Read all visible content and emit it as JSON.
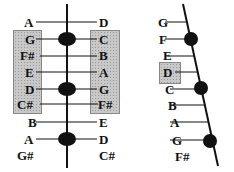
{
  "left_diagram": {
    "left_labels": [
      "A",
      "G",
      "F#",
      "E",
      "D",
      "C#",
      "B",
      "A",
      "G#"
    ],
    "right_labels": [
      "D",
      "C",
      "B",
      "A",
      "G",
      "F#",
      "E",
      "D",
      "C#"
    ],
    "dots_at_rows": [
      1,
      4,
      7
    ],
    "highlighted_rows": [
      1,
      2,
      3,
      4,
      5
    ]
  },
  "right_diagram": {
    "labels": [
      "G",
      "F",
      "E",
      "D",
      "C",
      "B",
      "A",
      "G",
      "F#"
    ],
    "dots_at_rows": [
      1,
      4,
      7
    ],
    "highlighted_label": "D"
  },
  "colors": {
    "ink": "#111111",
    "highlight": "#c8c8c8"
  }
}
